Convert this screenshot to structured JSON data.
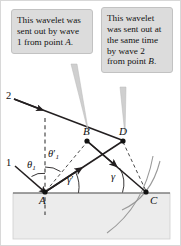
{
  "figure": {
    "background_color": "#ffffff",
    "callout_fill": "#dcdcdc",
    "callout_border": "#c2c2c2",
    "medium_fill": "#ececec",
    "line_color": "#231f20",
    "arc_color": "#9a9a9a"
  },
  "callouts": [
    {
      "id": "left",
      "lines": [
        "This wavelet was",
        "sent out by wave",
        "1 from point A."
      ],
      "text": "This wavelet was sent out by wave 1 from point A.",
      "italic_token": "A",
      "pointer_target": "B"
    },
    {
      "id": "right",
      "lines": [
        "This wavelet",
        "was sent out at",
        "the same time",
        "by wave 2",
        "from point B."
      ],
      "text": "This wavelet was sent out at the same time by wave 2 from point B.",
      "italic_token": "B",
      "pointer_target": "D"
    }
  ],
  "diagram": {
    "points": [
      {
        "name": "A",
        "label": "A",
        "x": 44,
        "y": 191,
        "dot": true
      },
      {
        "name": "B",
        "label": "B",
        "x": 86,
        "y": 140,
        "dot": true
      },
      {
        "name": "C",
        "label": "C",
        "x": 145,
        "y": 191,
        "dot": true
      },
      {
        "name": "D",
        "label": "D",
        "x": 122,
        "y": 140,
        "dot": true
      }
    ],
    "ray_labels": [
      {
        "name": "ray-1",
        "label": "1",
        "x": 8,
        "y": 163
      },
      {
        "name": "ray-2",
        "label": "2",
        "x": 8,
        "y": 96
      }
    ],
    "angle_labels": [
      {
        "name": "theta-1",
        "base": "θ",
        "sub": "1",
        "prime": false,
        "x": 30,
        "y": 162
      },
      {
        "name": "theta-1-prime",
        "base": "θ",
        "sub": "1",
        "prime": true,
        "x": 51,
        "y": 151
      },
      {
        "name": "gamma-prime",
        "base": "γ",
        "sub": "",
        "prime": true,
        "x": 70,
        "y": 179
      },
      {
        "name": "gamma",
        "base": "γ",
        "sub": "",
        "prime": false,
        "x": 113,
        "y": 176
      }
    ],
    "medium": {
      "label": "refracting-medium-block",
      "x": 12,
      "y": 192,
      "width": 157,
      "height": 46
    },
    "surface_y": 192
  }
}
